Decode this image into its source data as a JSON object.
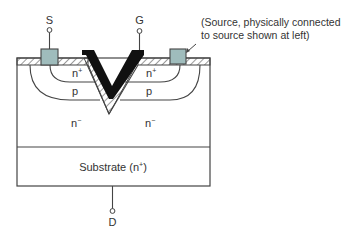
{
  "diagram": {
    "type": "V-groove MOSFET (VMOS) cross-section",
    "terminals": {
      "source": "S",
      "gate": "G",
      "drain": "D"
    },
    "regions": {
      "n_plus_left": "n",
      "n_plus_left_sup": "+",
      "n_plus_right": "n",
      "n_plus_right_sup": "+",
      "p_left": "p",
      "p_right": "p",
      "n_minus_left": "n",
      "n_minus_left_sup": "−",
      "n_minus_right": "n",
      "n_minus_right_sup": "−",
      "substrate": "Substrate (n",
      "substrate_sup": "+",
      "substrate_close": ")"
    },
    "annotation": {
      "line1": "(Source, physically connected",
      "line2": "to source shown at left)"
    },
    "colors": {
      "contact_fill": "#9fbcbc",
      "gate_fill": "#111111",
      "outline": "#444444",
      "text": "#333333"
    }
  }
}
